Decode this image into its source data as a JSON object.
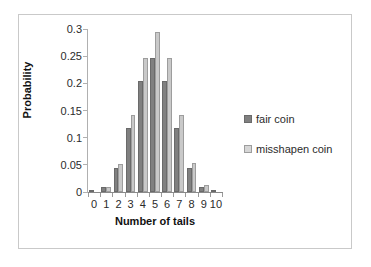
{
  "figure": {
    "border_color": "#c9c9c9",
    "background": "#ffffff"
  },
  "legend": {
    "position": "right",
    "entries": [
      {
        "label": "fair coin",
        "color": "#808080",
        "swatch": "legend-swatch-fair"
      },
      {
        "label": "misshapen coin",
        "color": "#c9c9c9",
        "swatch": "legend-swatch-misshapen"
      }
    ]
  },
  "axes": {
    "y_title": "Probability",
    "x_title": "Number of tails",
    "y_ticks": [
      "0",
      "0.05",
      "0.1",
      "0.15",
      "0.2",
      "0.25",
      "0.3"
    ],
    "x_ticks": [
      "0",
      "1",
      "2",
      "3",
      "4",
      "5",
      "6",
      "7",
      "8",
      "9",
      "10"
    ]
  },
  "chart_data": {
    "type": "bar",
    "title": "",
    "subtitle": "",
    "xlabel": "Number of tails",
    "ylabel": "Probability",
    "categories": [
      "0",
      "1",
      "2",
      "3",
      "4",
      "5",
      "6",
      "7",
      "8",
      "9",
      "10"
    ],
    "series": [
      {
        "name": "fair coin",
        "color": "#808080",
        "values": [
          0.001,
          0.01,
          0.044,
          0.117,
          0.205,
          0.246,
          0.205,
          0.117,
          0.044,
          0.01,
          0.001
        ]
      },
      {
        "name": "misshapen coin",
        "color": "#c9c9c9",
        "values": [
          0.0,
          0.01,
          0.052,
          0.142,
          0.246,
          0.295,
          0.246,
          0.142,
          0.053,
          0.012,
          0.0
        ]
      }
    ],
    "ylim": [
      0,
      0.3
    ],
    "ytick_step": 0.05,
    "grid": false,
    "legend_position": "right",
    "bar_group_count": 11,
    "series_count": 2
  }
}
